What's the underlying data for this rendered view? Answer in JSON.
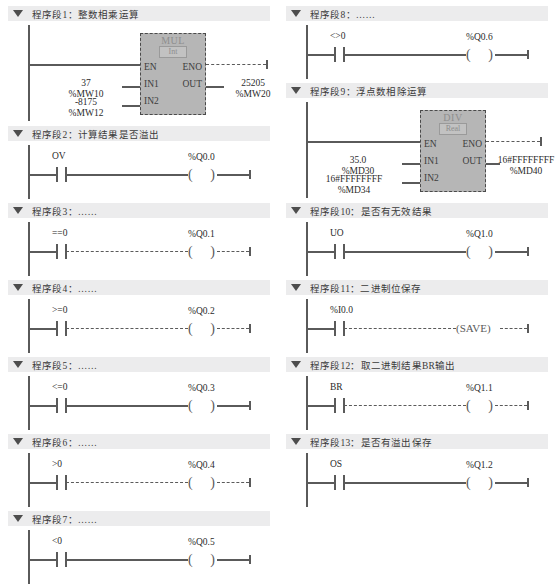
{
  "meta": {
    "language": "zh-CN",
    "diagram_type": "ladder-logic",
    "accent_block_fill": "#b6b6b6",
    "header_bar_fill": "#ececed",
    "wire_color": "#5a5a5a"
  },
  "left_column": [
    {
      "id": "network-1",
      "title": "程序段1：整数相乘运算",
      "kind": "block",
      "block": {
        "name": "MUL",
        "subtype": "Int",
        "en": "EN",
        "eno": "ENO",
        "in1": "IN1",
        "in2": "IN2",
        "out": "OUT",
        "in1_value": "37",
        "in1_operand": "%MW10",
        "in2_value": "-8175",
        "in2_operand": "%MW12",
        "out_value": "25205",
        "out_operand": "%MW20"
      }
    },
    {
      "id": "network-2",
      "title": "程序段2：计算结果是否溢出",
      "kind": "rung",
      "contact": "OV",
      "coil": "%Q0.0",
      "style": "solid"
    },
    {
      "id": "network-3",
      "title": "程序段3：……",
      "kind": "rung",
      "contact": "==0",
      "coil": "%Q0.1",
      "style": "dashed"
    },
    {
      "id": "network-4",
      "title": "程序段4：……",
      "kind": "rung",
      "contact": ">=0",
      "coil": "%Q0.2",
      "style": "dashed"
    },
    {
      "id": "network-5",
      "title": "程序段5：……",
      "kind": "rung",
      "contact": "<=0",
      "coil": "%Q0.3",
      "style": "solid"
    },
    {
      "id": "network-6",
      "title": "程序段6：……",
      "kind": "rung",
      "contact": ">0",
      "coil": "%Q0.4",
      "style": "dashed"
    },
    {
      "id": "network-7",
      "title": "程序段7：……",
      "kind": "rung",
      "contact": "<0",
      "coil": "%Q0.5",
      "style": "solid"
    }
  ],
  "right_column": [
    {
      "id": "network-8",
      "title": "程序段8：……",
      "kind": "rung",
      "contact": "<>0",
      "coil": "%Q0.6",
      "style": "solid"
    },
    {
      "id": "network-9",
      "title": "程序段9：浮点数相除运算",
      "kind": "block",
      "block": {
        "name": "DIV",
        "subtype": "Real",
        "en": "EN",
        "eno": "ENO",
        "in1": "IN1",
        "in2": "IN2",
        "out": "OUT",
        "in1_value": "35.0",
        "in1_operand": "%MD30",
        "in2_value": "16#FFFFFFFF",
        "in2_operand": "%MD34",
        "out_value": "16#FFFFFFFF",
        "out_operand": "%MD40"
      }
    },
    {
      "id": "network-10",
      "title": "程序段10：是否有无效结果",
      "kind": "rung",
      "contact": "UO",
      "coil": "%Q1.0",
      "style": "solid"
    },
    {
      "id": "network-11",
      "title": "程序段11：二进制位保存",
      "kind": "rung",
      "contact": "%I0.0",
      "coil": "(SAVE)",
      "coil_kind": "save",
      "style": "dashed"
    },
    {
      "id": "network-12",
      "title": "程序段12：取二进制结果BR输出",
      "kind": "rung",
      "contact": "BR",
      "coil": "%Q1.1",
      "style": "dashed"
    },
    {
      "id": "network-13",
      "title": "程序段13：是否有溢出保存",
      "kind": "rung",
      "contact": "OS",
      "coil": "%Q1.2",
      "style": "solid"
    }
  ]
}
